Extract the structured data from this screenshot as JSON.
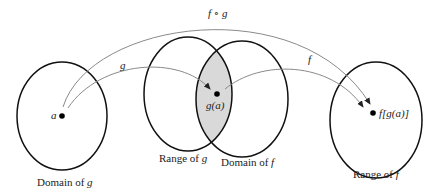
{
  "colors": {
    "ellipse_stroke": "#111111",
    "arrow_stroke": "#8a8a8a",
    "intersection_fill": "#d9d9d9",
    "point": "#000000"
  },
  "sets": [
    {
      "id": "domain-g",
      "label_text": "Domain of ",
      "label_var": "g"
    },
    {
      "id": "range-g",
      "label_text": "Range of ",
      "label_var": "g"
    },
    {
      "id": "domain-f",
      "label_text": "Domain of ",
      "label_var": "f"
    },
    {
      "id": "range-f",
      "label_text": "Range of ",
      "label_var": "f"
    }
  ],
  "points": {
    "a": "a",
    "g_of_a": "g(a)",
    "f_of_g_of_a": "f[g(a)]"
  },
  "arrows": {
    "g": "g",
    "f": "f",
    "composite": "f ∘ g"
  }
}
